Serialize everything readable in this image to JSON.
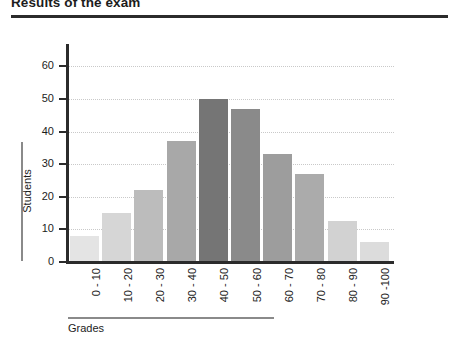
{
  "chart_data": {
    "type": "bar",
    "title": "Results of the exam",
    "xlabel": "Grades",
    "ylabel": "Students",
    "categories": [
      "0 - 10",
      "10 - 20",
      "20 - 30",
      "30 - 40",
      "40 - 50",
      "50 - 60",
      "60 - 70",
      "70 - 80",
      "80 - 90",
      "90 -100"
    ],
    "values": [
      8,
      15,
      22,
      37,
      50,
      47,
      33,
      27,
      12.5,
      6
    ],
    "ylim": [
      0,
      65
    ],
    "yticks": [
      0,
      10,
      20,
      30,
      40,
      50,
      60
    ],
    "ytick_labels": [
      "0",
      "10",
      "20",
      "30",
      "40",
      "50",
      "60"
    ],
    "grid": true,
    "legend": "none",
    "bar_colors": [
      "#e4e4e4",
      "#d6d6d6",
      "#bcbcbc",
      "#a8a8a8",
      "#757575",
      "#8a8a8a",
      "#9d9d9d",
      "#ababab",
      "#d2d2d2",
      "#dcdcdc"
    ],
    "axis_color": "#2b2b2b",
    "gridline_color": "#c9c9c9"
  }
}
